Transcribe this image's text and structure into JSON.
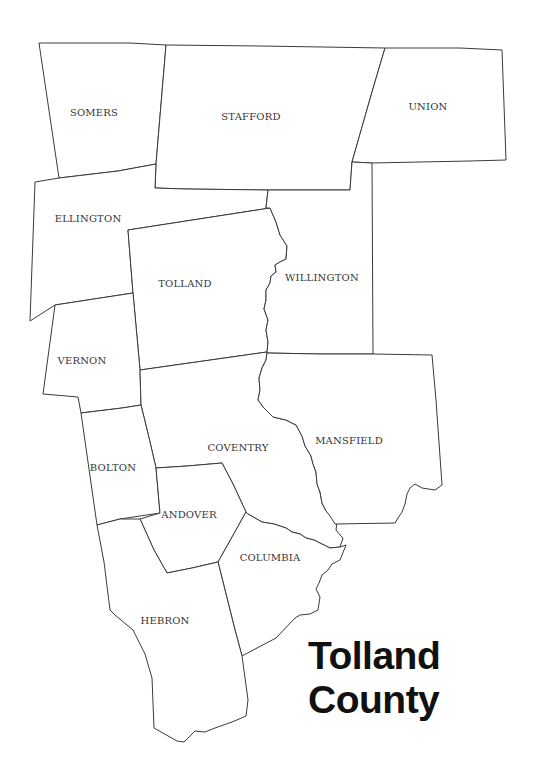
{
  "map": {
    "title_line1": "Tolland",
    "title_line2": "County",
    "stroke_color": "#3a3a3a",
    "fill_color": "#ffffff",
    "towns": [
      {
        "id": "somers",
        "label": "SOMERS",
        "x": 94,
        "y": 116
      },
      {
        "id": "stafford",
        "label": "STAFFORD",
        "x": 251,
        "y": 120
      },
      {
        "id": "union",
        "label": "UNION",
        "x": 428,
        "y": 110
      },
      {
        "id": "ellington",
        "label": "ELLINGTON",
        "x": 88,
        "y": 222
      },
      {
        "id": "tolland",
        "label": "TOLLAND",
        "x": 185,
        "y": 287
      },
      {
        "id": "willington",
        "label": "WILLINGTON",
        "x": 322,
        "y": 281
      },
      {
        "id": "vernon",
        "label": "VERNON",
        "x": 82,
        "y": 364
      },
      {
        "id": "coventry",
        "label": "COVENTRY",
        "x": 238,
        "y": 451
      },
      {
        "id": "mansfield",
        "label": "MANSFIELD",
        "x": 349,
        "y": 444
      },
      {
        "id": "bolton",
        "label": "BOLTON",
        "x": 113,
        "y": 471
      },
      {
        "id": "andover",
        "label": "ANDOVER",
        "x": 189,
        "y": 518
      },
      {
        "id": "columbia",
        "label": "COLUMBIA",
        "x": 270,
        "y": 561
      },
      {
        "id": "hebron",
        "label": "HEBRON",
        "x": 165,
        "y": 624
      }
    ]
  }
}
